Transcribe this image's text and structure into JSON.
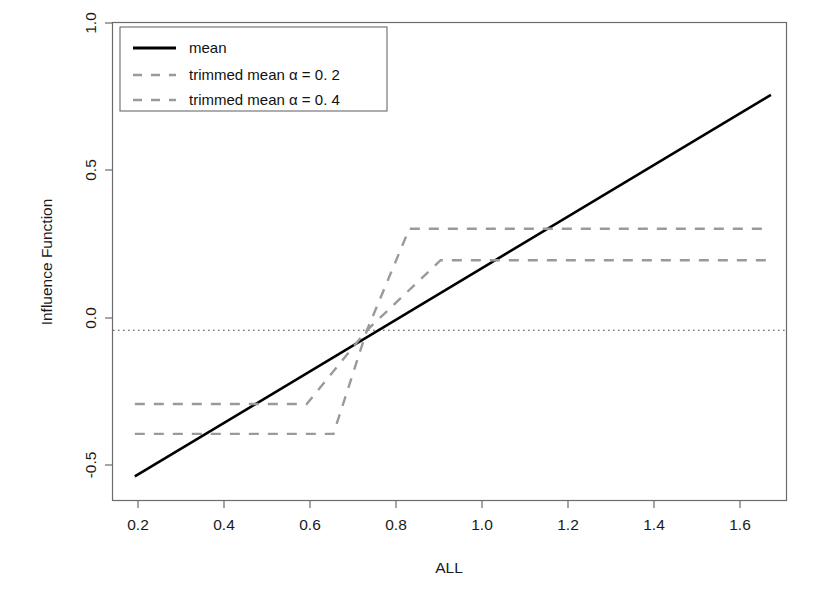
{
  "chart_data": {
    "type": "line",
    "title": "",
    "xlabel": "ALL",
    "ylabel": "Influence Function",
    "xlim": [
      0.155,
      1.665
    ],
    "ylim": [
      -0.6,
      1.085
    ],
    "xticks": [
      0.2,
      0.4,
      0.6,
      0.8,
      1.0,
      1.2,
      1.4,
      1.6
    ],
    "xtick_labels": [
      "0.2",
      "0.4",
      "0.6",
      "0.8",
      "1.0",
      "1.2",
      "1.4",
      "1.6"
    ],
    "yticks": [
      -0.5,
      0.0,
      0.5,
      1.0
    ],
    "ytick_labels": [
      "-0.5",
      "0.0",
      "0.5",
      "1.0"
    ],
    "grid": false,
    "legend_position": "top-left",
    "reference_lines": [
      {
        "name": "zero-line",
        "orientation": "horizontal",
        "y": 0.0,
        "style": "dotted",
        "color": "#444444"
      }
    ],
    "series": [
      {
        "name": "mean",
        "legend_label": "mean",
        "style": "solid",
        "color": "#000000",
        "width": 2.6,
        "points": [
          [
            0.205,
            -0.515
          ],
          [
            1.63,
            0.83
          ]
        ]
      },
      {
        "name": "trimmed mean alpha 0.2",
        "legend_label": "trimmed mean α = 0. 2",
        "style": "dashed",
        "color": "#9a9a9a",
        "width": 2.4,
        "points": [
          [
            0.205,
            -0.26
          ],
          [
            0.59,
            -0.26
          ],
          [
            0.725,
            0.0
          ],
          [
            0.89,
            0.247
          ],
          [
            1.63,
            0.247
          ]
        ]
      },
      {
        "name": "trimmed mean alpha 0.4",
        "legend_label": "trimmed mean α = 0. 4",
        "style": "dashed",
        "color": "#9a9a9a",
        "width": 2.4,
        "points": [
          [
            0.205,
            -0.365
          ],
          [
            0.65,
            -0.365
          ],
          [
            0.725,
            0.0
          ],
          [
            0.82,
            0.358
          ],
          [
            1.63,
            0.358
          ]
        ]
      }
    ],
    "annotations": []
  },
  "legend": {
    "items": [
      {
        "label": "mean",
        "style": "solid",
        "color": "#000000"
      },
      {
        "label": "trimmed mean α = 0. 2",
        "style": "dashed",
        "color": "#9a9a9a"
      },
      {
        "label": "trimmed mean α = 0. 4",
        "style": "dashed",
        "color": "#9a9a9a"
      }
    ]
  },
  "axes": {
    "x_title": "ALL",
    "y_title": "Influence Function",
    "x_tick_labels": [
      "0.2",
      "0.4",
      "0.6",
      "0.8",
      "1.0",
      "1.2",
      "1.4",
      "1.6"
    ],
    "y_tick_labels": [
      "-0.5",
      "0.0",
      "0.5",
      "1.0"
    ]
  },
  "colors": {
    "axis": "#6b6b6b",
    "solid_series": "#000000",
    "dashed_series": "#9a9a9a",
    "zero_line": "#4a4a4a",
    "text": "#1a1a1a",
    "background": "#ffffff"
  }
}
